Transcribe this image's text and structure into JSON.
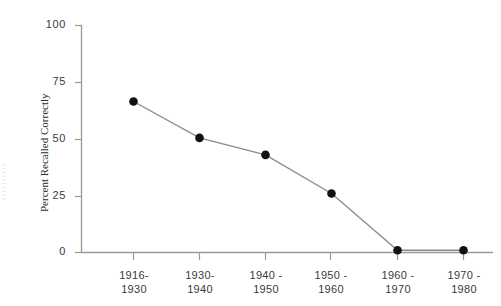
{
  "figure": {
    "background_color": "#ffffff",
    "axis_color": "#9a9a9a",
    "line_color": "#8c8c8c",
    "marker_color": "#111111",
    "text_color": "#3a3a3a",
    "scan_artifact_text": "i r r i i i i i i i"
  },
  "chart_data": {
    "type": "line",
    "title": "",
    "xlabel": "",
    "ylabel": "Percent Recalled Correctly",
    "categories": [
      "1916-1930",
      "1930-1940",
      "1940-1950",
      "1950-1960",
      "1960-1970",
      "1970-1980"
    ],
    "category_lines": [
      [
        "1916-",
        "1930"
      ],
      [
        "1930-",
        "1940"
      ],
      [
        "1940 -",
        "1950"
      ],
      [
        "1950 -",
        "1960"
      ],
      [
        "1960 -",
        "1970"
      ],
      [
        "1970 -",
        "1980"
      ]
    ],
    "values": [
      66.5,
      50.5,
      43.0,
      26.0,
      1.0,
      1.0
    ],
    "ylim": [
      0,
      100
    ],
    "yticks": [
      0,
      25,
      50,
      75,
      100
    ],
    "ytick_labels": [
      "0",
      "25",
      "50",
      "75",
      "100"
    ],
    "grid": false,
    "legend": "none",
    "marker": "filled-circle",
    "line_style": "solid"
  }
}
